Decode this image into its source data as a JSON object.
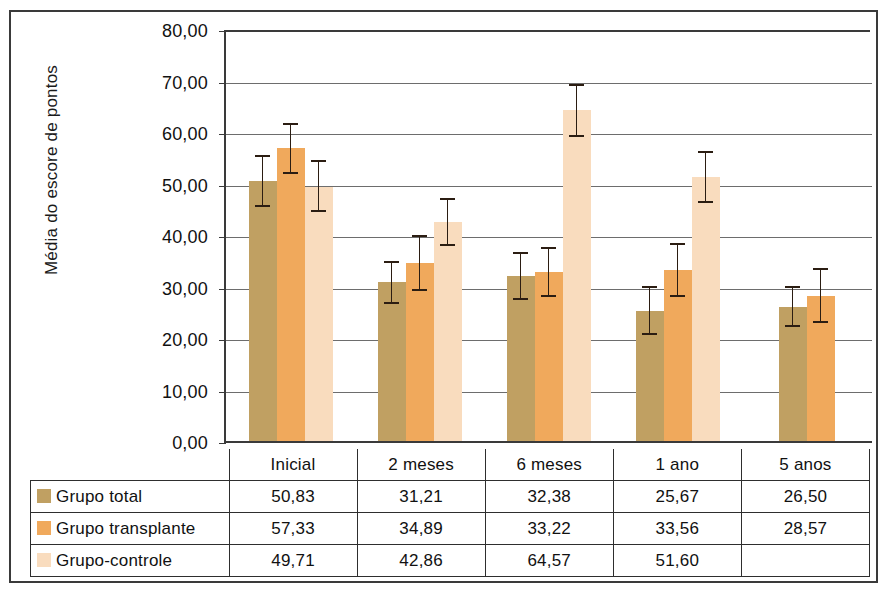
{
  "chart_data": {
    "type": "bar",
    "title": "",
    "xlabel": "",
    "ylabel": "Média do escore de pontos",
    "ylim": [
      0,
      80
    ],
    "ytick_step": 10,
    "ytick_labels": [
      "0,00",
      "10,00",
      "20,00",
      "30,00",
      "40,00",
      "50,00",
      "60,00",
      "70,00",
      "80,00"
    ],
    "ytick_values": [
      0,
      10,
      20,
      30,
      40,
      50,
      60,
      70,
      80
    ],
    "grid": true,
    "legend_position": "table-below",
    "categories": [
      "Inicial",
      "2 meses",
      "6 meses",
      "1 ano",
      "5 anos"
    ],
    "series": [
      {
        "name": "Grupo total",
        "color": "#c0a062",
        "values": [
          50.83,
          31.21,
          32.38,
          25.67,
          26.5
        ],
        "value_labels": [
          "50,83",
          "31,21",
          "32,38",
          "25,67",
          "26,50"
        ],
        "err_low": [
          45.8,
          27.0,
          27.8,
          20.9,
          22.5
        ],
        "err_high": [
          55.9,
          35.4,
          37.0,
          30.4,
          30.5
        ]
      },
      {
        "name": "Grupo transplante",
        "color": "#f0a95c",
        "values": [
          57.33,
          34.89,
          33.22,
          33.56,
          28.57
        ],
        "value_labels": [
          "57,33",
          "34,89",
          "33,22",
          "33,56",
          "28,57"
        ],
        "err_low": [
          52.2,
          29.5,
          28.4,
          28.3,
          23.3
        ],
        "err_high": [
          62.1,
          40.3,
          38.0,
          38.8,
          34.0
        ]
      },
      {
        "name": "Grupo-controle",
        "color": "#f9dcbe",
        "values": [
          49.71,
          42.86,
          64.57,
          51.6,
          null
        ],
        "value_labels": [
          "49,71",
          "42,86",
          "64,57",
          "51,60",
          ""
        ],
        "err_low": [
          44.9,
          38.2,
          59.4,
          46.6,
          null
        ],
        "err_high": [
          55.0,
          47.6,
          69.8,
          56.8,
          null
        ]
      }
    ]
  },
  "table": {
    "corner_label": "",
    "column_headers": [
      "Inicial",
      "2 meses",
      "6 meses",
      "1 ano",
      "5 anos"
    ],
    "rows": [
      {
        "label": "Grupo total",
        "color": "#c0a062",
        "cells": [
          "50,83",
          "31,21",
          "32,38",
          "25,67",
          "26,50"
        ]
      },
      {
        "label": "Grupo transplante",
        "color": "#f0a95c",
        "cells": [
          "57,33",
          "34,89",
          "33,22",
          "33,56",
          "28,57"
        ]
      },
      {
        "label": "Grupo-controle",
        "color": "#f9dcbe",
        "cells": [
          "49,71",
          "42,86",
          "64,57",
          "51,60",
          ""
        ]
      }
    ]
  }
}
